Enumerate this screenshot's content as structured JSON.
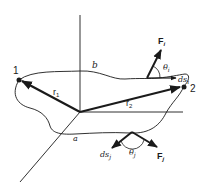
{
  "diagram": {
    "colors": {
      "ink": "#1a1a1a",
      "background": "#ffffff"
    },
    "labels": {
      "point_1": "1",
      "point_2": "2",
      "r1": "r",
      "r1_sub": "1",
      "r2": "r",
      "r2_sub": "2",
      "path_b": "b",
      "path_a": "a",
      "Fi": "F",
      "Fi_sub": "i",
      "dsi": "ds",
      "dsi_sub": "i",
      "theta_i": "θ",
      "theta_i_sub": "i",
      "Fj": "F",
      "Fj_sub": "j",
      "dsj": "ds",
      "dsj_sub": "j",
      "theta_j": "θ",
      "theta_j_sub": "j"
    }
  }
}
